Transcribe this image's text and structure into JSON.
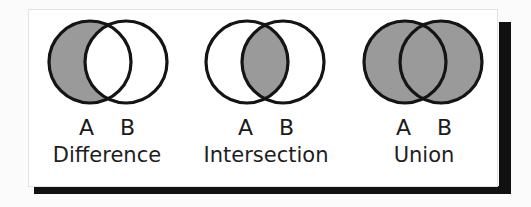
{
  "figure": {
    "background_color": "#fbfbfb",
    "card_color": "#ffffff",
    "shadow_color": "#111111",
    "stroke_color": "#141414",
    "fill_shaded": "#9a9a9a",
    "fill_empty": "#ffffff"
  },
  "panels": [
    {
      "id": "difference",
      "caption": "Difference",
      "label_a": "A",
      "label_b": "B",
      "shaded_regions": [
        "A-only"
      ],
      "circle_a_fill": "#9a9a9a",
      "circle_b_fill": "#ffffff",
      "overlap_fill": "#ffffff"
    },
    {
      "id": "intersection",
      "caption": "Intersection",
      "label_a": "A",
      "label_b": "B",
      "shaded_regions": [
        "A-and-B"
      ],
      "circle_a_fill": "#ffffff",
      "circle_b_fill": "#ffffff",
      "overlap_fill": "#9a9a9a"
    },
    {
      "id": "union",
      "caption": "Union",
      "label_a": "A",
      "label_b": "B",
      "shaded_regions": [
        "A-only",
        "A-and-B",
        "B-only"
      ],
      "circle_a_fill": "#9a9a9a",
      "circle_b_fill": "#9a9a9a",
      "overlap_fill": "#9a9a9a"
    }
  ]
}
